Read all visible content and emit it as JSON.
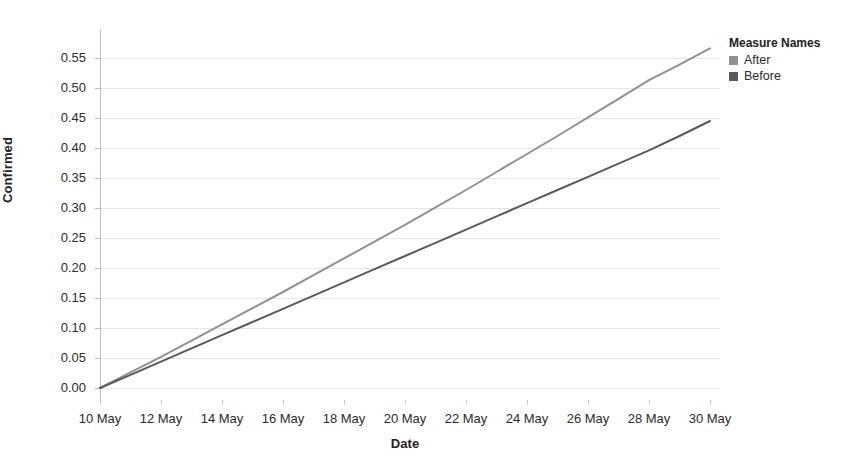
{
  "chart_data": {
    "type": "line",
    "title": "",
    "xlabel": "Date",
    "ylabel": "Confirmed",
    "x": [
      "10 May",
      "11 May",
      "12 May",
      "13 May",
      "14 May",
      "15 May",
      "16 May",
      "17 May",
      "18 May",
      "19 May",
      "20 May",
      "21 May",
      "22 May",
      "23 May",
      "24 May",
      "25 May",
      "26 May",
      "27 May",
      "28 May",
      "29 May",
      "30 May"
    ],
    "xtick_labels": [
      "10 May",
      "12 May",
      "14 May",
      "16 May",
      "18 May",
      "20 May",
      "22 May",
      "24 May",
      "26 May",
      "28 May",
      "30 May"
    ],
    "ytick_labels": [
      "0.00",
      "0.05",
      "0.10",
      "0.15",
      "0.20",
      "0.25",
      "0.30",
      "0.35",
      "0.40",
      "0.45",
      "0.50",
      "0.55"
    ],
    "ylim": [
      0.0,
      0.5667
    ],
    "ytick_values": [
      0.0,
      0.05,
      0.1,
      0.15,
      0.2,
      0.25,
      0.3,
      0.35,
      0.4,
      0.45,
      0.5,
      0.55
    ],
    "grid": "horizontal",
    "legend_position": "right",
    "series": [
      {
        "name": "After",
        "color": "#919191",
        "values": [
          0.0,
          0.026,
          0.052,
          0.079,
          0.106,
          0.133,
          0.16,
          0.188,
          0.216,
          0.244,
          0.272,
          0.301,
          0.33,
          0.36,
          0.39,
          0.42,
          0.451,
          0.482,
          0.513,
          0.539,
          0.566
        ]
      },
      {
        "name": "Before",
        "color": "#5a5a5a",
        "values": [
          0.0,
          0.022,
          0.044,
          0.066,
          0.088,
          0.11,
          0.132,
          0.154,
          0.176,
          0.198,
          0.22,
          0.242,
          0.264,
          0.286,
          0.308,
          0.33,
          0.352,
          0.374,
          0.396,
          0.42,
          0.445
        ]
      }
    ]
  },
  "legend": {
    "title": "Measure Names",
    "items": [
      {
        "label": "After",
        "color": "#919191"
      },
      {
        "label": "Before",
        "color": "#5a5a5a"
      }
    ]
  },
  "axes": {
    "y_title": "Confirmed",
    "x_title": "Date"
  }
}
